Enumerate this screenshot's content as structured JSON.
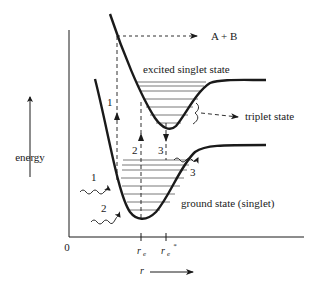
{
  "diagram": {
    "type": "potential-energy-curves",
    "labels": {
      "products": "A + B",
      "excited_state": "excited singlet state",
      "triplet_state": "triplet state",
      "ground_state": "ground state (singlet)",
      "y_axis": "energy",
      "x_axis": "r",
      "origin": "0",
      "r_e": "r",
      "r_e_sub": "e",
      "r_e_star": "r",
      "r_e_star_sub": "e",
      "r_e_star_sup": "*"
    },
    "transitions": [
      {
        "id": "1",
        "label": "1",
        "kind": "vertical-dashed-up",
        "description": "excitation to dissociative region"
      },
      {
        "id": "2",
        "label": "2",
        "kind": "vertical-dashed-up",
        "description": "excitation at r_e"
      },
      {
        "id": "3",
        "label": "3",
        "kind": "vertical-dashed-down",
        "description": "emission at r_e*"
      }
    ],
    "wavy_arrows": [
      {
        "label": "1"
      },
      {
        "label": "2"
      },
      {
        "label": "3"
      }
    ],
    "colors": {
      "line": "#1a1a1a",
      "background": "#ffffff"
    }
  }
}
